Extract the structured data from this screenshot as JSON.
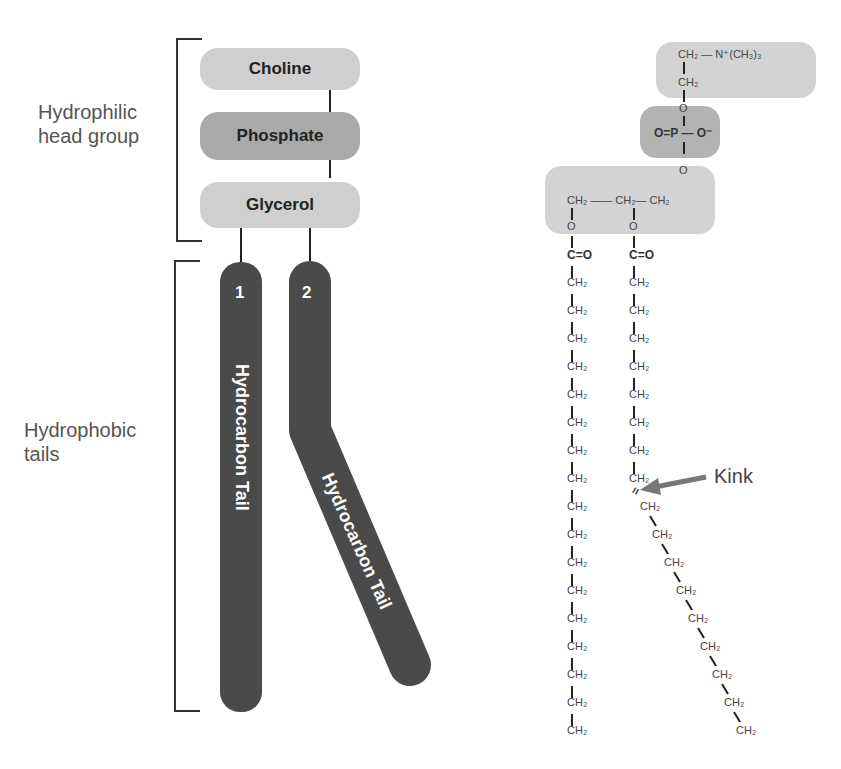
{
  "labels": {
    "hydrophilic_line1": "Hydrophilic",
    "hydrophilic_line2": "head group",
    "hydrophobic_line1": "Hydrophobic",
    "hydrophobic_line2": "tails",
    "kink": "Kink"
  },
  "head_groups": [
    {
      "label": "Choline",
      "color": "#cfcfcf"
    },
    {
      "label": "Phosphate",
      "color": "#a9a9a9"
    },
    {
      "label": "Glycerol",
      "color": "#cfcfcf"
    }
  ],
  "tails": [
    {
      "number": "1",
      "label": "Hydrocarbon Tail"
    },
    {
      "number": "2",
      "label": "Hydrocarbon Tail"
    }
  ],
  "formula": {
    "choline_top": "CH₂ — N⁺(CH₃)₃",
    "choline_ch2": "CH₂",
    "o1": "O",
    "phosphate": "O=P — O⁻",
    "o2": "O",
    "glycerol": "CH₂ —— CH₂— CH₂",
    "ester_o_left": "O",
    "ester_o_right": "O",
    "carbonyl_left": "C=O",
    "carbonyl_right": "C=O",
    "ch2": "CH₂",
    "double_bond": "="
  },
  "colors": {
    "tail": "#4a4a4a",
    "light_head": "#cfcfcf",
    "dark_head": "#a9a9a9",
    "arrow": "#777777"
  }
}
